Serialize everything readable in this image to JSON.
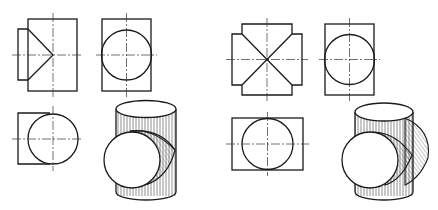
{
  "figure": {
    "colors": {
      "line": "#1a1a1a",
      "background": "#ffffff"
    },
    "left_group": {
      "name": "tee-junction",
      "views": [
        "front-view",
        "side-view",
        "top-view",
        "isometric-view"
      ]
    },
    "right_group": {
      "name": "cross-junction",
      "views": [
        "front-view",
        "side-view",
        "top-view",
        "isometric-view"
      ]
    }
  }
}
